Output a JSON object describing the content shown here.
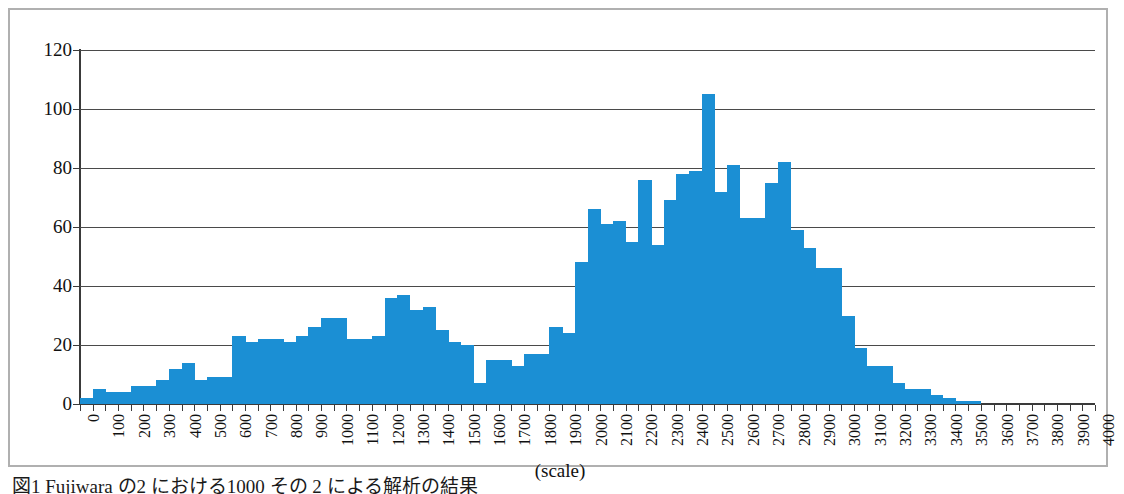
{
  "figure": {
    "caption_text": "図1 Fujiwara  の2  における1000 その 2  による解析の結果",
    "frame_border_color": "#b0b0b0"
  },
  "chart_data": {
    "type": "bar",
    "title": "",
    "subtitle": "",
    "xlabel": "(scale)",
    "ylabel": "",
    "bar_color": "#1b8fd4",
    "grid": true,
    "grid_axis": "y",
    "legend": false,
    "legend_position": "none",
    "xlim": [
      0,
      4000
    ],
    "ylim": [
      0,
      120
    ],
    "bin_width": 50,
    "y_ticks": [
      0,
      20,
      40,
      60,
      80,
      100,
      120
    ],
    "y_tick_labels": [
      "0",
      "20",
      "40",
      "60",
      "80",
      "100",
      "120"
    ],
    "x_ticks": [
      0,
      100,
      200,
      300,
      400,
      500,
      600,
      700,
      800,
      900,
      1000,
      1100,
      1200,
      1300,
      1400,
      1500,
      1600,
      1700,
      1800,
      1900,
      2000,
      2100,
      2200,
      2300,
      2400,
      2500,
      2600,
      2700,
      2800,
      2900,
      3000,
      3100,
      3200,
      3300,
      3400,
      3500,
      3600,
      3700,
      3800,
      3900,
      4000
    ],
    "x_tick_labels": [
      "0",
      "100",
      "200",
      "300",
      "400",
      "500",
      "600",
      "700",
      "800",
      "900",
      "1000",
      "1100",
      "1200",
      "1300",
      "1400",
      "1500",
      "1600",
      "1700",
      "1800",
      "1900",
      "2000",
      "2100",
      "2200",
      "2300",
      "2400",
      "2500",
      "2600",
      "2700",
      "2800",
      "2900",
      "3000",
      "3100",
      "3200",
      "3300",
      "3400",
      "3500",
      "3600",
      "3700",
      "3800",
      "3900",
      "4000"
    ],
    "x_tick_label_rotation": -90,
    "x": [
      0,
      50,
      100,
      150,
      200,
      250,
      300,
      350,
      400,
      450,
      500,
      550,
      600,
      650,
      700,
      750,
      800,
      850,
      900,
      950,
      1000,
      1050,
      1100,
      1150,
      1200,
      1250,
      1300,
      1350,
      1400,
      1450,
      1500,
      1550,
      1600,
      1650,
      1700,
      1750,
      1800,
      1850,
      1900,
      1950,
      2000,
      2050,
      2100,
      2150,
      2200,
      2250,
      2300,
      2350,
      2400,
      2450,
      2500,
      2550,
      2600,
      2650,
      2700,
      2750,
      2800,
      2850,
      2900,
      2950,
      3000,
      3050,
      3100,
      3150,
      3200,
      3250,
      3300,
      3350,
      3400,
      3450,
      3500,
      3550,
      3600,
      3650,
      3700,
      3750,
      3800,
      3850,
      3900,
      3950
    ],
    "values": [
      2,
      5,
      4,
      4,
      6,
      6,
      8,
      12,
      14,
      8,
      9,
      9,
      23,
      21,
      22,
      22,
      21,
      23,
      26,
      29,
      29,
      22,
      22,
      23,
      36,
      37,
      32,
      33,
      25,
      21,
      20,
      7,
      15,
      15,
      13,
      17,
      17,
      26,
      24,
      48,
      66,
      61,
      62,
      55,
      76,
      54,
      69,
      78,
      79,
      105,
      72,
      81,
      63,
      63,
      75,
      82,
      59,
      53,
      46,
      46,
      30,
      19,
      13,
      13,
      7,
      5,
      5,
      3,
      2,
      1,
      1,
      0,
      0,
      0,
      0,
      0,
      0,
      0,
      0,
      0
    ],
    "peak_value": 105,
    "peak_x": 2400,
    "annotations": []
  }
}
